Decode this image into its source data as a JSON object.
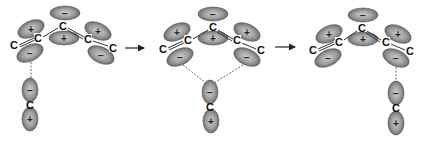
{
  "figure": {
    "colors": {
      "lobe_fill_light": "#c8c8c8",
      "lobe_fill_dark": "#6e6e6e",
      "lobe_stroke": "#555555",
      "bond": "#333333",
      "text": "#111111"
    },
    "atom_label": "C",
    "plus_sign": "+",
    "minus_sign": "−",
    "arrows": [
      {
        "from": [
          125,
          48
        ],
        "to": [
          146,
          48
        ]
      },
      {
        "from": [
          275,
          47
        ],
        "to": [
          297,
          47
        ]
      }
    ],
    "panels": [
      {
        "name": "left-interaction",
        "atoms": [
          {
            "label": "C",
            "x": 14,
            "y": 46
          },
          {
            "label": "C",
            "x": 38,
            "y": 39
          },
          {
            "label": "C",
            "x": 63,
            "y": 27
          },
          {
            "label": "C",
            "x": 88,
            "y": 40
          },
          {
            "label": "C",
            "x": 113,
            "y": 49
          }
        ],
        "bonds": [
          [
            19,
            45,
            34,
            38
          ],
          [
            43,
            37,
            58,
            28
          ],
          [
            68,
            28,
            84,
            37
          ],
          [
            93,
            41,
            108,
            46
          ]
        ],
        "double_bonds": [
          [
            19,
            45,
            34,
            38
          ],
          [
            68,
            28,
            84,
            37
          ]
        ],
        "lobes": [
          {
            "x": 65,
            "y": 13,
            "rx": 15,
            "ry": 7,
            "rot": 0,
            "sign": "−"
          },
          {
            "x": 64,
            "y": 38,
            "rx": 15,
            "ry": 7,
            "rot": 0,
            "sign": "+"
          },
          {
            "x": 31,
            "y": 29,
            "rx": 14,
            "ry": 8,
            "rot": -25,
            "sign": "+"
          },
          {
            "x": 30,
            "y": 53,
            "rx": 14,
            "ry": 8,
            "rot": -25,
            "sign": "−"
          },
          {
            "x": 98,
            "y": 31,
            "rx": 14,
            "ry": 8,
            "rot": 25,
            "sign": "+"
          },
          {
            "x": 101,
            "y": 55,
            "rx": 14,
            "ry": 8,
            "rot": 25,
            "sign": "−"
          },
          {
            "x": 30,
            "y": 90,
            "rx": 8,
            "ry": 12,
            "rot": 0,
            "sign": "−"
          },
          {
            "x": 30,
            "y": 119,
            "rx": 8,
            "ry": 12,
            "rot": 0,
            "sign": "+"
          }
        ],
        "bottom_atom": {
          "label": "C",
          "x": 30,
          "y": 106
        },
        "dashes": [
          [
            31,
            62,
            31,
            78
          ]
        ]
      },
      {
        "name": "both-interaction",
        "atoms": [
          {
            "label": "C",
            "x": 163,
            "y": 50
          },
          {
            "label": "C",
            "x": 188,
            "y": 41
          },
          {
            "label": "C",
            "x": 213,
            "y": 28
          },
          {
            "label": "C",
            "x": 237,
            "y": 41
          },
          {
            "label": "C",
            "x": 261,
            "y": 51
          }
        ],
        "bonds": [
          [
            168,
            48,
            183,
            41
          ],
          [
            193,
            39,
            208,
            30
          ],
          [
            218,
            30,
            233,
            39
          ],
          [
            242,
            43,
            256,
            49
          ]
        ],
        "double_bonds": [
          [
            168,
            48,
            183,
            41
          ],
          [
            218,
            30,
            233,
            39
          ]
        ],
        "lobes": [
          {
            "x": 213,
            "y": 14,
            "rx": 15,
            "ry": 7,
            "rot": 0,
            "sign": "−"
          },
          {
            "x": 213,
            "y": 38,
            "rx": 15,
            "ry": 7,
            "rot": 0,
            "sign": "+"
          },
          {
            "x": 177,
            "y": 32,
            "rx": 14,
            "ry": 8,
            "rot": -25,
            "sign": "+"
          },
          {
            "x": 180,
            "y": 57,
            "rx": 14,
            "ry": 8,
            "rot": -25,
            "sign": "−"
          },
          {
            "x": 247,
            "y": 32,
            "rx": 14,
            "ry": 8,
            "rot": 25,
            "sign": "+"
          },
          {
            "x": 247,
            "y": 57,
            "rx": 14,
            "ry": 8,
            "rot": 25,
            "sign": "−"
          },
          {
            "x": 210,
            "y": 92,
            "rx": 8,
            "ry": 12,
            "rot": 0,
            "sign": "−"
          },
          {
            "x": 211,
            "y": 121,
            "rx": 8,
            "ry": 12,
            "rot": 0,
            "sign": "+"
          }
        ],
        "bottom_atom": {
          "label": "C",
          "x": 210,
          "y": 108
        },
        "dashes": [
          [
            183,
            65,
            206,
            83
          ],
          [
            243,
            65,
            214,
            83
          ]
        ]
      },
      {
        "name": "right-interaction",
        "atoms": [
          {
            "label": "C",
            "x": 313,
            "y": 51
          },
          {
            "label": "C",
            "x": 339,
            "y": 43
          },
          {
            "label": "C",
            "x": 362,
            "y": 29
          },
          {
            "label": "C",
            "x": 386,
            "y": 43
          },
          {
            "label": "C",
            "x": 410,
            "y": 52
          }
        ],
        "bonds": [
          [
            318,
            49,
            334,
            42
          ],
          [
            344,
            40,
            357,
            31
          ],
          [
            367,
            31,
            381,
            40
          ],
          [
            391,
            44,
            405,
            50
          ]
        ],
        "double_bonds": [
          [
            318,
            49,
            334,
            42
          ],
          [
            367,
            31,
            381,
            40
          ]
        ],
        "lobes": [
          {
            "x": 363,
            "y": 15,
            "rx": 15,
            "ry": 7,
            "rot": 0,
            "sign": "−"
          },
          {
            "x": 363,
            "y": 39,
            "rx": 15,
            "ry": 7,
            "rot": 0,
            "sign": "+"
          },
          {
            "x": 329,
            "y": 34,
            "rx": 14,
            "ry": 8,
            "rot": -25,
            "sign": "+"
          },
          {
            "x": 328,
            "y": 58,
            "rx": 14,
            "ry": 8,
            "rot": -25,
            "sign": "−"
          },
          {
            "x": 398,
            "y": 34,
            "rx": 14,
            "ry": 8,
            "rot": 25,
            "sign": "+"
          },
          {
            "x": 396,
            "y": 58,
            "rx": 14,
            "ry": 8,
            "rot": 25,
            "sign": "−"
          },
          {
            "x": 396,
            "y": 93,
            "rx": 8,
            "ry": 12,
            "rot": 0,
            "sign": "−"
          },
          {
            "x": 396,
            "y": 123,
            "rx": 8,
            "ry": 12,
            "rot": 0,
            "sign": "+"
          }
        ],
        "bottom_atom": {
          "label": "C",
          "x": 396,
          "y": 109
        },
        "dashes": [
          [
            396,
            67,
            396,
            81
          ]
        ]
      }
    ]
  }
}
